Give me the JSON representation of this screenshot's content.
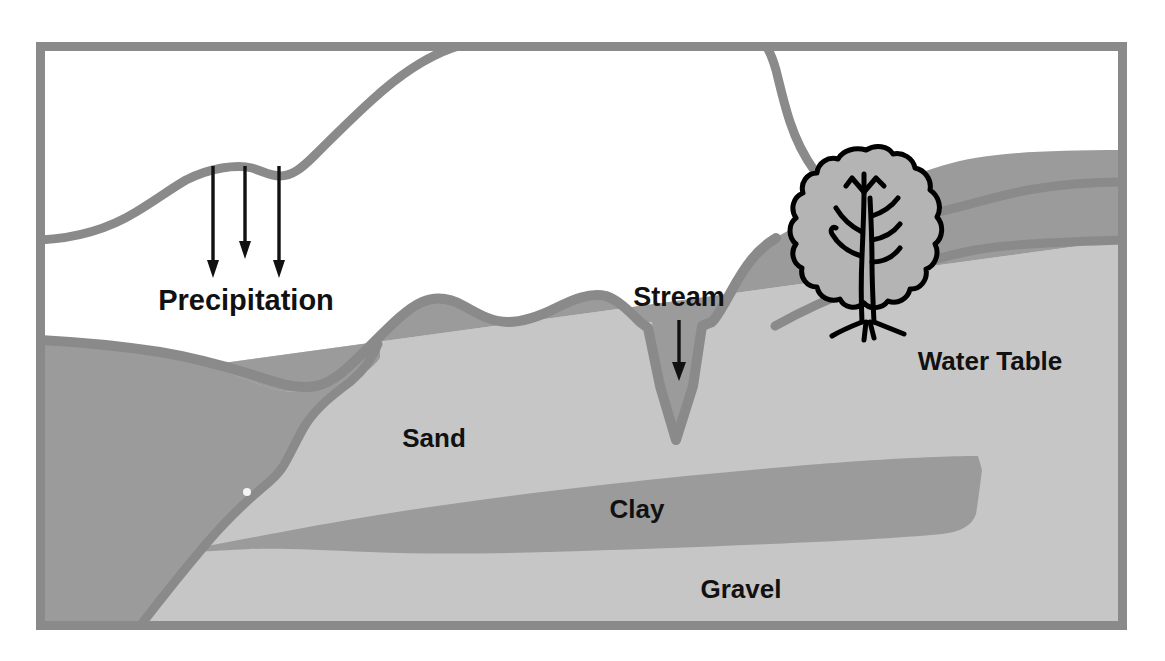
{
  "diagram": {
    "type": "geologic-cross-section",
    "canvas": {
      "width": 1165,
      "height": 661
    },
    "frame": {
      "name": "diagram-border",
      "x": 36,
      "y": 42,
      "width": 1091,
      "height": 588,
      "stroke_color": "#8a8a8a",
      "stroke_width": 9
    },
    "labels": {
      "precipitation": "Precipitation",
      "stream": "Stream",
      "water_table": "Water Table",
      "sand": "Sand",
      "clay": "Clay",
      "gravel": "Gravel"
    },
    "label_positions": {
      "precipitation": {
        "x": 246,
        "y": 310,
        "font_size": 29,
        "anchor": "middle"
      },
      "stream": {
        "x": 679,
        "y": 306,
        "font_size": 27,
        "anchor": "middle"
      },
      "water_table": {
        "x": 990,
        "y": 368,
        "font_size": 26,
        "anchor": "middle"
      },
      "sand": {
        "x": 434,
        "y": 447,
        "font_size": 26,
        "anchor": "middle"
      },
      "clay": {
        "x": 637,
        "y": 518,
        "font_size": 26,
        "anchor": "middle"
      },
      "gravel": {
        "x": 741,
        "y": 598,
        "font_size": 26,
        "anchor": "middle"
      }
    },
    "colors": {
      "air_sky": "#ffffff",
      "unsaturated_soil": "#f1f1f1",
      "saturated_zone": "#9b9b9b",
      "sand_layer": "#c6c6c6",
      "clay_layer": "#9b9b9b",
      "gravel_layer": "#c6c6c6",
      "outline_gray": "#8a8a8a",
      "tree_outline": "#000000",
      "tree_fill": "#b4b4b4",
      "arrow_black": "#111111",
      "label_text": "#111111"
    },
    "arrows": {
      "precipitation": [
        {
          "name": "precipitation-arrow-1",
          "x": 213,
          "y_start": 166,
          "y_end": 275
        },
        {
          "name": "precipitation-arrow-2",
          "x": 245,
          "y_start": 166,
          "y_end": 256
        },
        {
          "name": "precipitation-arrow-3",
          "x": 279,
          "y_start": 166,
          "y_end": 275
        }
      ],
      "stream": {
        "name": "stream-arrow",
        "x": 679,
        "y_start": 320,
        "y_end": 378
      }
    },
    "features": {
      "tree": {
        "name": "deciduous-tree",
        "crown_center_x": 866,
        "crown_center_y": 208,
        "trunk_base_y": 322
      },
      "stream_channel": {
        "name": "stream-channel",
        "center_x": 676,
        "top_y": 320,
        "bottom_y": 440
      },
      "water_table_line": {
        "name": "water-table-surface",
        "left_y": 388,
        "right_y": 240
      }
    }
  },
  "legend_items": [
    {
      "name": "precipitation",
      "label": "Precipitation",
      "description": "Downward arrows representing rainfall infiltrating the ground"
    },
    {
      "name": "stream",
      "label": "Stream",
      "description": "Surface water channel incised below the water table"
    },
    {
      "name": "water-table",
      "label": "Water Table",
      "description": "Upper surface of the saturated zone"
    },
    {
      "name": "sand",
      "label": "Sand",
      "description": "Permeable aquifer layer"
    },
    {
      "name": "clay",
      "label": "Clay",
      "description": "Low permeability confining lens"
    },
    {
      "name": "gravel",
      "label": "Gravel",
      "description": "Coarse permeable basal layer"
    }
  ]
}
